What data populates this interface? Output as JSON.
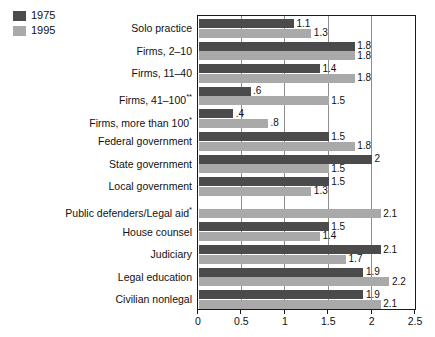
{
  "legend": {
    "entries": [
      {
        "label": "1975",
        "color": "#4b4b4b"
      },
      {
        "label": "1995",
        "color": "#a9a9a9"
      }
    ]
  },
  "axis": {
    "ticks": [
      "0",
      "0.5",
      "1",
      "1.5",
      "2",
      "2.5"
    ]
  },
  "chart_data": {
    "type": "bar",
    "orientation": "horizontal",
    "title": "",
    "xlabel": "",
    "ylabel": "",
    "xlim": [
      0,
      2.5
    ],
    "grid": true,
    "gridlines": [
      0.5,
      1,
      1.5,
      2
    ],
    "legend_position": "top-left",
    "categories": [
      "Solo practice",
      "Firms, 2–10",
      "Firms, 11–40",
      "Firms, 41–100**",
      "Firms, more than 100*",
      "Federal government",
      "State government",
      "Local government",
      "Public defenders/Legal aid*",
      "House counsel",
      "Judiciary",
      "Legal education",
      "Civilian nonlegal"
    ],
    "series": [
      {
        "name": "1975",
        "color": "#4b4b4b",
        "values": [
          1.1,
          1.8,
          1.4,
          0.6,
          0.4,
          1.5,
          2.0,
          1.5,
          null,
          1.5,
          2.1,
          1.9,
          1.9
        ],
        "labels": [
          "1.1",
          "1.8",
          "1.4",
          ".6",
          ".4",
          "1.5",
          "2",
          "1.5",
          "",
          "1.5",
          "2.1",
          "1.9",
          "1.9"
        ]
      },
      {
        "name": "1995",
        "color": "#a9a9a9",
        "values": [
          1.3,
          1.8,
          1.8,
          1.5,
          0.8,
          1.8,
          1.5,
          1.3,
          2.1,
          1.4,
          1.7,
          2.2,
          2.1
        ],
        "labels": [
          "1.3",
          "1.8",
          "1.8",
          "1.5",
          ".8",
          "1.8",
          "1.5",
          "1.3",
          "2.1",
          "1.4",
          "1.7",
          "2.2",
          "2.1"
        ]
      }
    ]
  }
}
